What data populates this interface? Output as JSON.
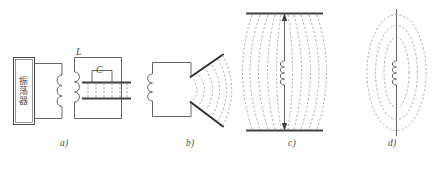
{
  "figure": {
    "kind": "physics-diagram",
    "description_domain": "electromagnetic-oscillator-to-dipole-antenna-evolution",
    "background_color": "#ffffff",
    "line_color": "#555555",
    "dash_color": "#9a9a9a",
    "text_color": "#4a4a4a"
  },
  "panels": [
    {
      "id": "a",
      "label": "a)",
      "label_x": 60,
      "label_y": 143,
      "block": {
        "name": "oscillator-block",
        "chars": [
          "振",
          "荡",
          "器"
        ],
        "text": "振荡器"
      },
      "symbols": [
        {
          "name": "inductor-label",
          "text": "L",
          "x": 76,
          "y": 46
        },
        {
          "name": "capacitor-label",
          "text": "C",
          "x": 96,
          "y": 64
        }
      ]
    },
    {
      "id": "b",
      "label": "b)",
      "label_x": 186,
      "label_y": 143
    },
    {
      "id": "c",
      "label": "c)",
      "label_x": 288,
      "label_y": 143
    },
    {
      "id": "d",
      "label": "d)",
      "label_x": 388,
      "label_y": 143
    }
  ],
  "geometry": {
    "canvas_width": 440,
    "canvas_height": 173,
    "panel_a": {
      "osc_box": {
        "x": 13,
        "y": 57,
        "w": 22,
        "h": 68
      },
      "primary_loop": {
        "x": 35,
        "y": 63,
        "w": 28,
        "h": 56
      },
      "secondary_loop": {
        "x": 74,
        "y": 57,
        "w": 48,
        "h": 62
      },
      "cap_plate_top_y": 82,
      "cap_plate_bottom_y": 98,
      "cap_plate_x1": 82,
      "cap_plate_x2": 130,
      "field_line_count": 6
    },
    "panel_b": {
      "loop": {
        "x": 152,
        "y": 62,
        "w": 38,
        "h": 54
      },
      "rod_upper": {
        "x1": 190,
        "y1": 76,
        "x2": 222,
        "y2": 55
      },
      "rod_lower": {
        "x1": 190,
        "y1": 102,
        "x2": 222,
        "y2": 126
      },
      "field_arc_count": 5
    },
    "panel_c": {
      "plate_top": {
        "x1": 246,
        "y1": 14,
        "x2": 322,
        "y2": 14
      },
      "plate_bottom": {
        "x1": 246,
        "y1": 130,
        "x2": 322,
        "y2": 130
      },
      "axis_x": 284,
      "coil_center_y": 72,
      "field_arc_count": 8
    },
    "panel_d": {
      "axis_x": 396,
      "axis_y1": 10,
      "axis_y2": 134,
      "coil_center_y": 72,
      "ellipse_count": 3
    }
  }
}
